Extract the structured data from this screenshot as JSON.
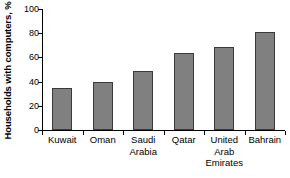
{
  "chart_data": {
    "type": "bar",
    "title": "",
    "subtitle": "",
    "xlabel": "",
    "ylabel": "Households with computers, %",
    "categories": [
      "Kuwait",
      "Oman",
      "Saudi Arabia",
      "Qatar",
      "United Arab Emirates",
      "Bahrain"
    ],
    "values": [
      35,
      40,
      49,
      64,
      69,
      81
    ],
    "ylim": [
      0,
      100
    ],
    "yticks": [
      0,
      20,
      40,
      60,
      80,
      100
    ],
    "ytick_labels": [
      "0",
      "20",
      "40",
      "60",
      "80",
      "100"
    ],
    "grid": false,
    "legend": false,
    "legend_position": "none",
    "bar_color": "#808080",
    "bar_edge_color": "#3a3a3a",
    "background_color": "#ffffff",
    "axis_color": "#000000"
  },
  "axes": {
    "y_title": "Households with computers, %",
    "y_ticks": [
      {
        "value": 100,
        "label": "100"
      },
      {
        "value": 80,
        "label": "80"
      },
      {
        "value": 60,
        "label": "60"
      },
      {
        "value": 40,
        "label": "40"
      },
      {
        "value": 20,
        "label": "20"
      },
      {
        "value": 0,
        "label": "0"
      }
    ]
  },
  "bars": [
    {
      "category": "Kuwait",
      "label": "Kuwait",
      "value": 35
    },
    {
      "category": "Oman",
      "label": "Oman",
      "value": 40
    },
    {
      "category": "Saudi Arabia",
      "label": "Saudi\nArabia",
      "value": 49
    },
    {
      "category": "Qatar",
      "label": "Qatar",
      "value": 64
    },
    {
      "category": "United Arab Emirates",
      "label": "United\nArab\nEmirates",
      "value": 69
    },
    {
      "category": "Bahrain",
      "label": "Bahrain",
      "value": 81
    }
  ]
}
